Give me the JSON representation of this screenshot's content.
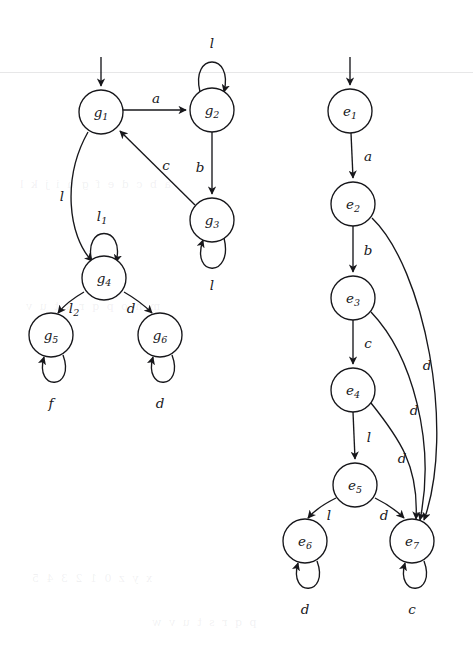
{
  "figure": {
    "kind": "two-state-transition-diagrams",
    "background_color": "#ffffff",
    "ink_color": "#17171b",
    "bleed_through_lines": [
      "a b c d e f g h i j k l",
      "m n o p q r s t u v",
      "x y z 0 1 2 3 4 5",
      "p q r s t u v w"
    ]
  },
  "graphs": [
    {
      "id": "graph-g",
      "name": "automaton-g",
      "start_state": "g1",
      "nodes": [
        {
          "id": "g1",
          "base": "g",
          "sub": "1",
          "cx": 101,
          "cy": 112,
          "r": 22
        },
        {
          "id": "g2",
          "base": "g",
          "sub": "2",
          "cx": 212,
          "cy": 110,
          "r": 22
        },
        {
          "id": "g3",
          "base": "g",
          "sub": "3",
          "cx": 212,
          "cy": 220,
          "r": 22
        },
        {
          "id": "g4",
          "base": "g",
          "sub": "4",
          "cx": 104,
          "cy": 278,
          "r": 22
        },
        {
          "id": "g5",
          "base": "g",
          "sub": "5",
          "cx": 51,
          "cy": 335,
          "r": 22
        },
        {
          "id": "g6",
          "base": "g",
          "sub": "6",
          "cx": 160,
          "cy": 335,
          "r": 22
        }
      ],
      "edges": [
        {
          "from": "g1",
          "to": "g2",
          "label": "a",
          "sub": "",
          "lx": 156,
          "ly": 99
        },
        {
          "from": "g2",
          "to": "g2",
          "label": "l",
          "sub": "",
          "lx": 212,
          "ly": 44,
          "self": true
        },
        {
          "from": "g2",
          "to": "g3",
          "label": "b",
          "sub": "",
          "lx": 200,
          "ly": 168
        },
        {
          "from": "g3",
          "to": "g1",
          "label": "c",
          "sub": "",
          "lx": 166,
          "ly": 166
        },
        {
          "from": "g3",
          "to": "g3",
          "label": "l",
          "sub": "",
          "lx": 212,
          "ly": 286,
          "self": true
        },
        {
          "from": "g1",
          "to": "g4",
          "label": "l",
          "sub": "",
          "lx": 62,
          "ly": 197
        },
        {
          "from": "g4",
          "to": "g4",
          "label": "l",
          "sub": "1",
          "lx": 104,
          "ly": 217,
          "self": true
        },
        {
          "from": "g4",
          "to": "g5",
          "label": "l",
          "sub": "2",
          "lx": 76,
          "ly": 309
        },
        {
          "from": "g4",
          "to": "g6",
          "label": "d",
          "sub": "",
          "lx": 131,
          "ly": 309
        },
        {
          "from": "g5",
          "to": "g5",
          "label": "f",
          "sub": "",
          "lx": 51,
          "ly": 404,
          "self": true
        },
        {
          "from": "g6",
          "to": "g6",
          "label": "d",
          "sub": "",
          "lx": 160,
          "ly": 404,
          "self": true
        }
      ]
    },
    {
      "id": "graph-e",
      "name": "automaton-e",
      "start_state": "e1",
      "nodes": [
        {
          "id": "e1",
          "base": "e",
          "sub": "1",
          "cx": 350,
          "cy": 111,
          "r": 22
        },
        {
          "id": "e2",
          "base": "e",
          "sub": "2",
          "cx": 353,
          "cy": 204,
          "r": 22
        },
        {
          "id": "e3",
          "base": "e",
          "sub": "3",
          "cx": 353,
          "cy": 298,
          "r": 22
        },
        {
          "id": "e4",
          "base": "e",
          "sub": "4",
          "cx": 353,
          "cy": 390,
          "r": 22
        },
        {
          "id": "e5",
          "base": "e",
          "sub": "5",
          "cx": 355,
          "cy": 485,
          "r": 22
        },
        {
          "id": "e6",
          "base": "e",
          "sub": "6",
          "cx": 305,
          "cy": 541,
          "r": 22
        },
        {
          "id": "e7",
          "base": "e",
          "sub": "7",
          "cx": 412,
          "cy": 541,
          "r": 22
        }
      ],
      "edges": [
        {
          "from": "e1",
          "to": "e2",
          "label": "a",
          "sub": "",
          "lx": 368,
          "ly": 157
        },
        {
          "from": "e2",
          "to": "e3",
          "label": "b",
          "sub": "",
          "lx": 368,
          "ly": 251
        },
        {
          "from": "e3",
          "to": "e4",
          "label": "c",
          "sub": "",
          "lx": 368,
          "ly": 344
        },
        {
          "from": "e4",
          "to": "e5",
          "label": "l",
          "sub": "",
          "lx": 369,
          "ly": 438
        },
        {
          "from": "e2",
          "to": "e7",
          "label": "d",
          "sub": "",
          "lx": 427,
          "ly": 366
        },
        {
          "from": "e3",
          "to": "e7",
          "label": "d",
          "sub": "",
          "lx": 414,
          "ly": 411
        },
        {
          "from": "e4",
          "to": "e7",
          "label": "d",
          "sub": "",
          "lx": 402,
          "ly": 459
        },
        {
          "from": "e5",
          "to": "e6",
          "label": "l",
          "sub": "",
          "lx": 329,
          "ly": 516
        },
        {
          "from": "e5",
          "to": "e7",
          "label": "d",
          "sub": "",
          "lx": 384,
          "ly": 516
        },
        {
          "from": "e6",
          "to": "e6",
          "label": "d",
          "sub": "",
          "lx": 305,
          "ly": 610,
          "self": true
        },
        {
          "from": "e7",
          "to": "e7",
          "label": "c",
          "sub": "",
          "lx": 412,
          "ly": 610,
          "self": true
        }
      ]
    }
  ],
  "alphabet_labels": [
    "a",
    "b",
    "c",
    "d",
    "f",
    "l",
    "l1",
    "l2"
  ]
}
